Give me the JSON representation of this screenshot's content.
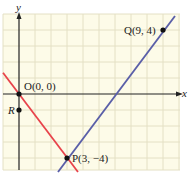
{
  "diagram": {
    "type": "coordinate-plane",
    "axes": {
      "x_label": "x",
      "y_label": "y"
    },
    "grid": {
      "x_range": [
        -1,
        10
      ],
      "y_range": [
        -4.75,
        5
      ],
      "step": 1
    },
    "colors": {
      "background": "#fdfbe8",
      "grid": "#e4e0c4",
      "axis": "#222222",
      "line_red": "#e8434b",
      "line_blue": "#5a5fa8",
      "point": "#111111"
    },
    "points": [
      {
        "name": "O",
        "label": "O(0, 0)",
        "x": 0,
        "y": 0
      },
      {
        "name": "R",
        "label": "R",
        "x": 0,
        "y": -1
      },
      {
        "name": "P",
        "label": "P(3, −4)",
        "x": 3,
        "y": -4
      },
      {
        "name": "Q",
        "label": "Q(9, 4)",
        "x": 9,
        "y": 4
      }
    ],
    "lines": [
      {
        "name": "red-line",
        "through": [
          "O",
          "P"
        ],
        "slope": "-4/3"
      },
      {
        "name": "blue-line",
        "through": [
          "P",
          "Q"
        ],
        "slope": "4/3"
      }
    ]
  }
}
